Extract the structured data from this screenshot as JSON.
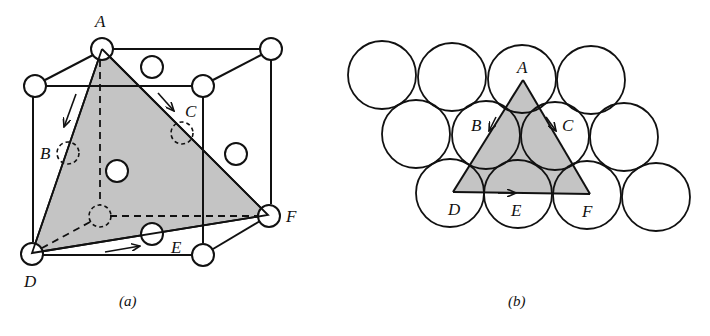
{
  "figure": {
    "panel_a": {
      "caption": "(a)",
      "description": "FCC unit cell with shaded (111) close-packed plane through corner atoms A, D, F",
      "labels": {
        "A": "A",
        "B": "B",
        "C": "C",
        "D": "D",
        "E": "E",
        "F": "F"
      },
      "plane_color": "#c4c4c4"
    },
    "panel_b": {
      "caption": "(b)",
      "description": "Close-packed layer of spheres with triangle ADF overlaid; arrows show slip directions",
      "labels": {
        "A": "A",
        "B": "B",
        "C": "C",
        "D": "D",
        "E": "E",
        "F": "F"
      },
      "rows": [
        4,
        4,
        5
      ],
      "plane_color": "#c4c4c4"
    }
  }
}
